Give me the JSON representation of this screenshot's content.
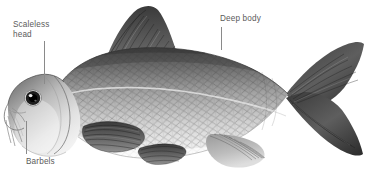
{
  "figure": {
    "style": "grayscale scientific illustration",
    "background_color": "#ffffff",
    "width": 368,
    "height": 182
  },
  "annotations": [
    {
      "id": "scaleless-head",
      "text": "Scaleless\nhead",
      "text_x": 13,
      "text_y": 20,
      "leader": {
        "x": 44,
        "y1": 41,
        "y2": 84
      }
    },
    {
      "id": "deep-body",
      "text": "Deep body",
      "text_x": 220,
      "text_y": 14,
      "leader": {
        "x": 221,
        "y1": 27,
        "y2": 50
      }
    },
    {
      "id": "barbels",
      "text": "Barbels",
      "text_x": 26,
      "text_y": 157,
      "leader": {
        "x": 26,
        "y1": 121,
        "y2": 154
      }
    }
  ],
  "label_color": "#5b5b5b",
  "leader_color": "#8a8a8a",
  "anatomy": {
    "parts": [
      "dorsal-fin",
      "caudal-fin",
      "anal-fin",
      "pelvic-fin",
      "pectoral-fin",
      "head",
      "eye",
      "barbel",
      "gill-cover",
      "lateral-line",
      "scales"
    ]
  }
}
